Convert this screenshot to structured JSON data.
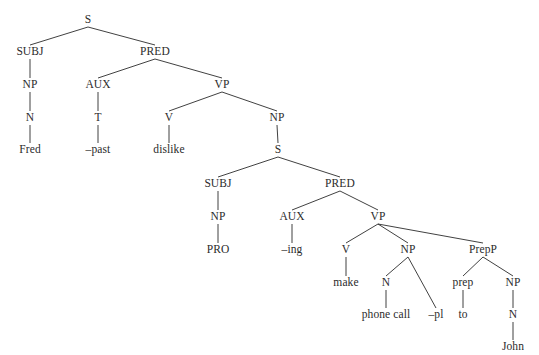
{
  "figure": {
    "kind": "syntax-tree",
    "sentence": "Fred –past dislike PRO –ing make phone call –pl to John",
    "caption_fragment": "",
    "ink_color": "#2b2b2b",
    "background_color": "#ffffff",
    "width": 539,
    "height": 355
  },
  "nodes": [
    {
      "id": "s-root",
      "label": "S",
      "x": 88,
      "y": 20,
      "type": "category"
    },
    {
      "id": "subj-1",
      "label": "SUBJ",
      "x": 30,
      "y": 52,
      "type": "category"
    },
    {
      "id": "pred-1",
      "label": "PRED",
      "x": 155,
      "y": 52,
      "type": "category"
    },
    {
      "id": "np-1",
      "label": "NP",
      "x": 30,
      "y": 85,
      "type": "category"
    },
    {
      "id": "aux-1",
      "label": "AUX",
      "x": 98,
      "y": 85,
      "type": "category"
    },
    {
      "id": "vp-1",
      "label": "VP",
      "x": 222,
      "y": 85,
      "type": "category"
    },
    {
      "id": "n-1",
      "label": "N",
      "x": 30,
      "y": 118,
      "type": "category"
    },
    {
      "id": "t-1",
      "label": "T",
      "x": 98,
      "y": 118,
      "type": "category"
    },
    {
      "id": "v-1",
      "label": "V",
      "x": 169,
      "y": 118,
      "type": "category"
    },
    {
      "id": "np-2",
      "label": "NP",
      "x": 277,
      "y": 118,
      "type": "category"
    },
    {
      "id": "lex-fred",
      "label": "Fred",
      "x": 30,
      "y": 150,
      "type": "lexical"
    },
    {
      "id": "lex-past",
      "label": "–past",
      "x": 98,
      "y": 150,
      "type": "lexical"
    },
    {
      "id": "lex-dislike",
      "label": "dislike",
      "x": 169,
      "y": 150,
      "type": "lexical"
    },
    {
      "id": "s-embedded",
      "label": "S",
      "x": 278,
      "y": 150,
      "type": "category"
    },
    {
      "id": "subj-2",
      "label": "SUBJ",
      "x": 218,
      "y": 184,
      "type": "category"
    },
    {
      "id": "pred-2",
      "label": "PRED",
      "x": 340,
      "y": 184,
      "type": "category"
    },
    {
      "id": "np-3",
      "label": "NP",
      "x": 218,
      "y": 217,
      "type": "category"
    },
    {
      "id": "aux-2",
      "label": "AUX",
      "x": 292,
      "y": 217,
      "type": "category"
    },
    {
      "id": "vp-2",
      "label": "VP",
      "x": 378,
      "y": 217,
      "type": "category"
    },
    {
      "id": "lex-pro",
      "label": "PRO",
      "x": 218,
      "y": 250,
      "type": "lexical"
    },
    {
      "id": "lex-ing",
      "label": "–ing",
      "x": 292,
      "y": 250,
      "type": "lexical"
    },
    {
      "id": "v-2",
      "label": "V",
      "x": 346,
      "y": 250,
      "type": "category"
    },
    {
      "id": "np-4",
      "label": "NP",
      "x": 408,
      "y": 250,
      "type": "category"
    },
    {
      "id": "prepp-1",
      "label": "PrepP",
      "x": 483,
      "y": 250,
      "type": "category"
    },
    {
      "id": "lex-make",
      "label": "make",
      "x": 346,
      "y": 283,
      "type": "lexical"
    },
    {
      "id": "n-2",
      "label": "N",
      "x": 386,
      "y": 283,
      "type": "category"
    },
    {
      "id": "prep-1",
      "label": "prep",
      "x": 463,
      "y": 283,
      "type": "category"
    },
    {
      "id": "np-5",
      "label": "NP",
      "x": 513,
      "y": 283,
      "type": "category"
    },
    {
      "id": "lex-phonecall",
      "label": "phone call",
      "x": 386,
      "y": 315,
      "type": "lexical"
    },
    {
      "id": "lex-pl",
      "label": "–pl",
      "x": 436,
      "y": 315,
      "type": "lexical"
    },
    {
      "id": "lex-to",
      "label": "to",
      "x": 463,
      "y": 315,
      "type": "lexical"
    },
    {
      "id": "n-3",
      "label": "N",
      "x": 513,
      "y": 315,
      "type": "category"
    },
    {
      "id": "lex-john",
      "label": "John",
      "x": 513,
      "y": 347,
      "type": "lexical"
    }
  ],
  "edges": [
    {
      "from": "s-root",
      "to": "subj-1"
    },
    {
      "from": "s-root",
      "to": "pred-1"
    },
    {
      "from": "subj-1",
      "to": "np-1"
    },
    {
      "from": "pred-1",
      "to": "aux-1"
    },
    {
      "from": "pred-1",
      "to": "vp-1"
    },
    {
      "from": "np-1",
      "to": "n-1"
    },
    {
      "from": "aux-1",
      "to": "t-1"
    },
    {
      "from": "vp-1",
      "to": "v-1"
    },
    {
      "from": "vp-1",
      "to": "np-2"
    },
    {
      "from": "n-1",
      "to": "lex-fred"
    },
    {
      "from": "t-1",
      "to": "lex-past"
    },
    {
      "from": "v-1",
      "to": "lex-dislike"
    },
    {
      "from": "np-2",
      "to": "s-embedded"
    },
    {
      "from": "s-embedded",
      "to": "subj-2"
    },
    {
      "from": "s-embedded",
      "to": "pred-2"
    },
    {
      "from": "subj-2",
      "to": "np-3"
    },
    {
      "from": "pred-2",
      "to": "aux-2"
    },
    {
      "from": "pred-2",
      "to": "vp-2"
    },
    {
      "from": "np-3",
      "to": "lex-pro"
    },
    {
      "from": "aux-2",
      "to": "lex-ing"
    },
    {
      "from": "vp-2",
      "to": "v-2"
    },
    {
      "from": "vp-2",
      "to": "np-4"
    },
    {
      "from": "vp-2",
      "to": "prepp-1"
    },
    {
      "from": "v-2",
      "to": "lex-make"
    },
    {
      "from": "np-4",
      "to": "n-2"
    },
    {
      "from": "np-4",
      "to": "lex-pl"
    },
    {
      "from": "prepp-1",
      "to": "prep-1"
    },
    {
      "from": "prepp-1",
      "to": "np-5"
    },
    {
      "from": "n-2",
      "to": "lex-phonecall"
    },
    {
      "from": "prep-1",
      "to": "lex-to"
    },
    {
      "from": "np-5",
      "to": "n-3"
    },
    {
      "from": "n-3",
      "to": "lex-john"
    }
  ]
}
